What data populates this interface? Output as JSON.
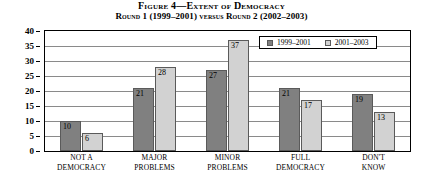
{
  "chart_data": {
    "type": "bar",
    "title": "Figure 4—Extent of Democracy",
    "subtitle": "Round 1 (1999–2001) versus Round 2 (2002–2003)",
    "xlabel": "",
    "ylabel": "",
    "ylim": [
      0,
      40
    ],
    "ytick_step": 5,
    "yticks": [
      "0",
      "5",
      "10",
      "15",
      "20",
      "25",
      "30",
      "35",
      "40"
    ],
    "grid": "horizontal",
    "legend_position": "top-right-inside",
    "categories": [
      "NOT A DEMOCRACY",
      "MAJOR PROBLEMS",
      "MINOR PROBLEMS",
      "FULL DEMOCRACY",
      "DON'T KNOW"
    ],
    "category_lines": [
      [
        "NOT A",
        "DEMOCRACY"
      ],
      [
        "MAJOR",
        "PROBLEMS"
      ],
      [
        "MINOR",
        "PROBLEMS"
      ],
      [
        "FULL",
        "DEMOCRACY"
      ],
      [
        "DON'T",
        "KNOW"
      ]
    ],
    "series": [
      {
        "name": "1999–2001",
        "color": "#808080",
        "values": [
          10,
          21,
          27,
          21,
          19
        ]
      },
      {
        "name": "2001–2003",
        "color": "#d2d2d2",
        "values": [
          6,
          28,
          37,
          17,
          13
        ]
      }
    ]
  }
}
